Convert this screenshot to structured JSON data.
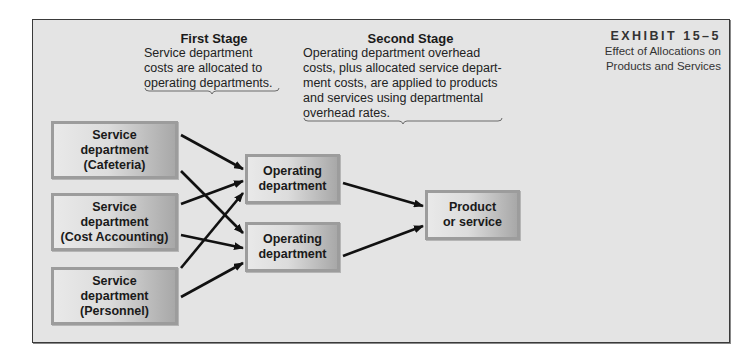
{
  "exhibit": {
    "label": "EXHIBIT 15–5",
    "caption_line1": "Effect of Allocations on",
    "caption_line2": "Products and Services"
  },
  "stages": [
    {
      "title": "First Stage",
      "lines": [
        "Service department",
        "costs are allocated to",
        "operating departments."
      ]
    },
    {
      "title": "Second Stage",
      "lines": [
        "Operating department overhead",
        "costs, plus allocated service depart-",
        "ment costs, are applied to products",
        "and services using departmental",
        "overhead rates."
      ]
    }
  ],
  "service_departments": [
    {
      "line1": "Service",
      "line2": "department",
      "line3": "(Cafeteria)"
    },
    {
      "line1": "Service",
      "line2": "department",
      "line3": "(Cost Accounting)"
    },
    {
      "line1": "Service",
      "line2": "department",
      "line3": "(Personnel)"
    }
  ],
  "operating_departments": [
    {
      "line1": "Operating",
      "line2": "department"
    },
    {
      "line1": "Operating",
      "line2": "department"
    }
  ],
  "product": {
    "line1": "Product",
    "line2": "or service"
  },
  "colors": {
    "frame_bg": "#e4e4e4",
    "frame_border": "#3a3a3a",
    "box_border": "#9c9c9c",
    "arrow": "#111111"
  }
}
